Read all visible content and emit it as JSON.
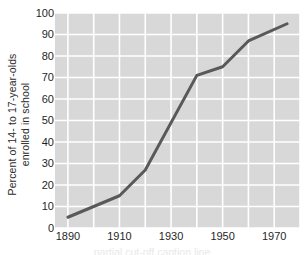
{
  "chart_data": {
    "type": "line",
    "title": "",
    "xlabel": "",
    "ylabel": "Percent of 14- to 17-year-olds\nenrolled in school",
    "x": [
      1890,
      1910,
      1920,
      1940,
      1950,
      1960,
      1975
    ],
    "values": [
      5,
      15,
      27,
      71,
      75,
      87,
      95
    ],
    "series": [
      {
        "name": "Percent of 14- to 17-year-olds enrolled in school",
        "x": [
          1890,
          1910,
          1920,
          1940,
          1950,
          1960,
          1975
        ],
        "values": [
          5,
          15,
          27,
          71,
          75,
          87,
          95
        ]
      }
    ],
    "xlim": [
      1885,
      1980
    ],
    "ylim": [
      0,
      100
    ],
    "xticks": [
      1890,
      1910,
      1930,
      1950,
      1970
    ],
    "xtick_labels": [
      "1890",
      "1910",
      "1930",
      "1950",
      "1970"
    ],
    "yticks": [
      0,
      10,
      20,
      30,
      40,
      50,
      60,
      70,
      80,
      90,
      100
    ],
    "ytick_labels": [
      "0",
      "10",
      "20",
      "30",
      "40",
      "50",
      "60",
      "70",
      "80",
      "90",
      "100"
    ],
    "x_minor_step": 10,
    "grid": true,
    "grid_color": "#ffffff",
    "plot_bg_color": "#d8d8d8",
    "line_color": "#595959",
    "line_width": 3,
    "legend": false,
    "legend_position": "none",
    "markers": false,
    "annotations": []
  },
  "caption": {
    "text": "partial cut-off caption line"
  }
}
